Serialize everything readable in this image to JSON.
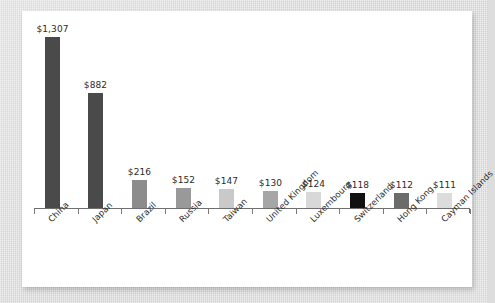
{
  "canvas": {
    "backdrop_color": "#dcdcdc",
    "panel_color": "#ffffff"
  },
  "chart_data": {
    "type": "bar",
    "title": "",
    "subtitle": "",
    "xlabel": "",
    "ylabel": "",
    "grid": false,
    "legend": "none",
    "ylim": [
      0,
      1307
    ],
    "axis_color": "#6e6e6e",
    "categories": [
      "China",
      "Japan",
      "Brazil",
      "Russia",
      "Taiwan",
      "United Kingdom",
      "Luxembourg",
      "Switzerland",
      "Hong Kong",
      "Cayman Islands"
    ],
    "values": [
      1307,
      882,
      216,
      152,
      147,
      130,
      124,
      118,
      112,
      111
    ],
    "value_labels": [
      "$1,307",
      "$882",
      "$216",
      "$152",
      "$147",
      "$130",
      "$124",
      "$118",
      "$112",
      "$111"
    ],
    "bar_colors": [
      "#4a4a4a",
      "#4a4a4a",
      "#8c8c8c",
      "#999999",
      "#c9c9c9",
      "#a6a6a6",
      "#d8d8d8",
      "#111111",
      "#6b6b6b",
      "#dcdcdc"
    ]
  }
}
